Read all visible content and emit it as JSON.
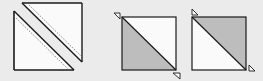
{
  "diagram": {
    "type": "half-square-triangle-quilt-steps",
    "colors": {
      "background": "#ebebeb",
      "outline": "#1a1a1a",
      "light_fabric": "#fafafa",
      "dark_fabric": "#bdbdbd",
      "seam": "#555555"
    },
    "figures": [
      {
        "id": "cut-square",
        "description": "Square cut along diagonal with seam lines on both sides, pieces separated",
        "pieces": [
          "upper-right-triangle",
          "lower-left-triangle"
        ],
        "seam_lines": "dashed"
      },
      {
        "id": "hst-dark-lower-left",
        "description": "Half-square triangle, dark lower-left, light upper-right",
        "dark_half": "lower-left",
        "markers": [
          "top-left",
          "bottom-right"
        ]
      },
      {
        "id": "hst-dark-upper-right",
        "description": "Half-square triangle, dark upper-right, light lower-left",
        "dark_half": "upper-right",
        "markers": [
          "top-left",
          "bottom-right"
        ]
      }
    ]
  }
}
